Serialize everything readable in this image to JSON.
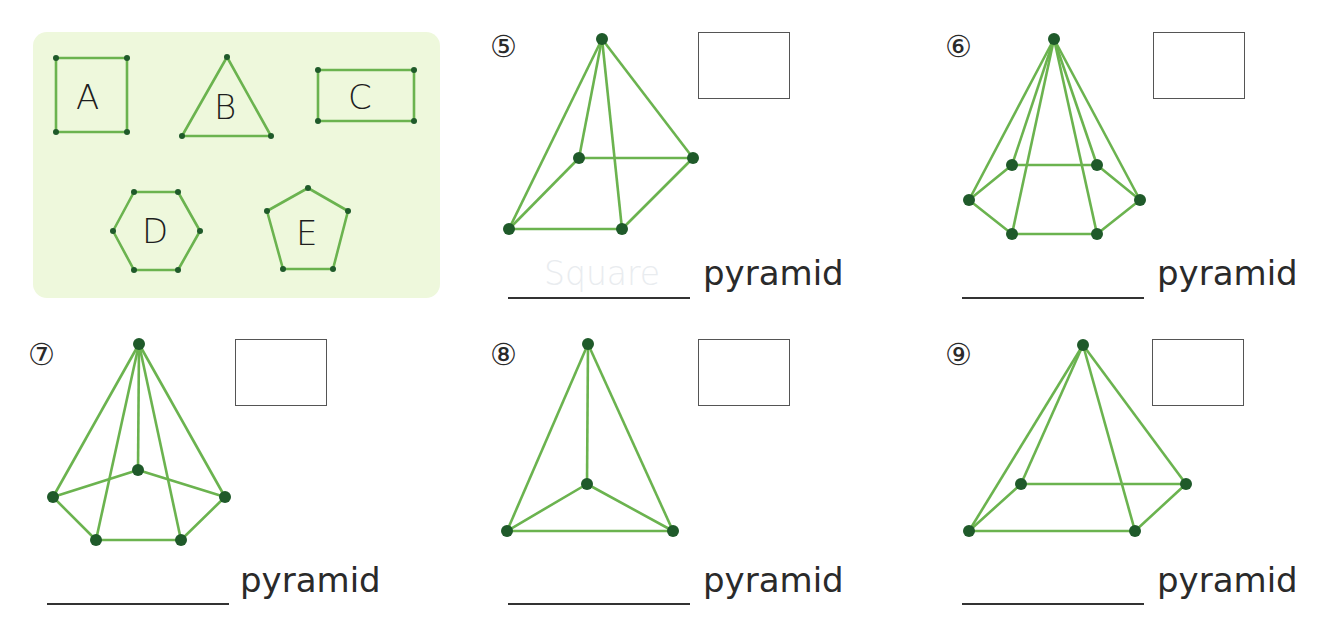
{
  "colors": {
    "edge": "#6bb34f",
    "vertex": "#1f5a2a",
    "panel_bg": "#eef8dc",
    "text": "#2a2a2a",
    "hint_text": "#e9ecef"
  },
  "legend": {
    "shapes": [
      {
        "letter": "A",
        "name": "square"
      },
      {
        "letter": "B",
        "name": "triangle"
      },
      {
        "letter": "C",
        "name": "rectangle"
      },
      {
        "letter": "D",
        "name": "hexagon"
      },
      {
        "letter": "E",
        "name": "pentagon"
      }
    ]
  },
  "questions": [
    {
      "number": "⑤",
      "box_value": "",
      "blank_value": "Square",
      "suffix": "pyramid"
    },
    {
      "number": "⑥",
      "box_value": "",
      "blank_value": "",
      "suffix": "pyramid"
    },
    {
      "number": "⑦",
      "box_value": "",
      "blank_value": "",
      "suffix": "pyramid"
    },
    {
      "number": "⑧",
      "box_value": "",
      "blank_value": "",
      "suffix": "pyramid"
    },
    {
      "number": "⑨",
      "box_value": "",
      "blank_value": "",
      "suffix": "pyramid"
    }
  ]
}
